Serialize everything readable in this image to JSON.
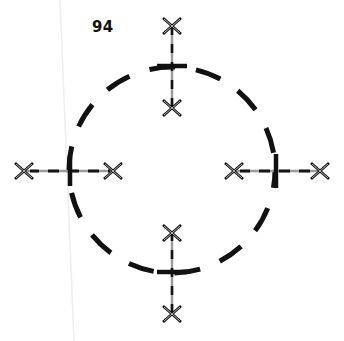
{
  "figure": {
    "callout_number": "94",
    "background_color": "#ffffff",
    "ink_color": "#101010",
    "leader_line_color": "#9a9a9a",
    "leader_dash_color": "#111111",
    "artifact_line_color": "#f2f0ee",
    "circle": {
      "name": "dashed-circle",
      "center_x": 172,
      "center_y": 170,
      "radius": 103,
      "stroke_width": 5,
      "dash_pattern": "26 21",
      "dash_offset": 8,
      "color": "#111111"
    },
    "artifact_line": {
      "name": "scan-artifact-line",
      "x1": 60,
      "y1": 0,
      "x2": 74,
      "y2": 341,
      "width": 1.6,
      "color": "#f0eeec"
    },
    "ticks": [
      {
        "name": "tick-top",
        "cx": 172,
        "cy": 66,
        "orientation": "horizontal",
        "length": 30,
        "thickness": 4.5
      },
      {
        "name": "tick-bottom",
        "cx": 172,
        "cy": 272,
        "orientation": "horizontal",
        "length": 30,
        "thickness": 4.5
      },
      {
        "name": "tick-left",
        "cx": 70,
        "cy": 171,
        "orientation": "vertical",
        "length": 30,
        "thickness": 4.5
      },
      {
        "name": "tick-right",
        "cx": 276,
        "cy": 171,
        "orientation": "vertical",
        "length": 34,
        "thickness": 4.5
      }
    ],
    "leaders": [
      {
        "name": "leader-top",
        "orientation": "vertical",
        "x1": 172,
        "y1": 26,
        "x2": 172,
        "y2": 108,
        "arrow_start": "x-arrow",
        "arrow_end": "x-arrow",
        "crosses_tick": "tick-top"
      },
      {
        "name": "leader-bottom",
        "orientation": "vertical",
        "x1": 172,
        "y1": 233,
        "x2": 172,
        "y2": 314,
        "arrow_start": "x-arrow",
        "arrow_end": "x-arrow",
        "crosses_tick": "tick-bottom"
      },
      {
        "name": "leader-left",
        "orientation": "horizontal",
        "x1": 24,
        "y1": 171,
        "x2": 113,
        "y2": 171,
        "arrow_start": "x-arrow",
        "arrow_end": "x-arrow",
        "crosses_tick": "tick-left"
      },
      {
        "name": "leader-right",
        "orientation": "horizontal",
        "x1": 234,
        "y1": 171,
        "x2": 320,
        "y2": 171,
        "arrow_start": "x-arrow",
        "arrow_end": "x-arrow",
        "crosses_tick": "tick-right"
      }
    ],
    "arrow_marks": [
      {
        "name": "x-arrow-top-upper",
        "cx": 172,
        "cy": 26,
        "size": 9
      },
      {
        "name": "x-arrow-top-lower",
        "cx": 172,
        "cy": 108,
        "size": 9
      },
      {
        "name": "x-arrow-bottom-upper",
        "cx": 172,
        "cy": 233,
        "size": 9
      },
      {
        "name": "x-arrow-bottom-lower",
        "cx": 172,
        "cy": 314,
        "size": 9
      },
      {
        "name": "x-arrow-left-outer",
        "cx": 24,
        "cy": 171,
        "size": 9
      },
      {
        "name": "x-arrow-left-inner",
        "cx": 113,
        "cy": 171,
        "size": 9
      },
      {
        "name": "x-arrow-right-inner",
        "cx": 234,
        "cy": 171,
        "size": 9
      },
      {
        "name": "x-arrow-right-outer",
        "cx": 320,
        "cy": 171,
        "size": 9
      }
    ]
  }
}
